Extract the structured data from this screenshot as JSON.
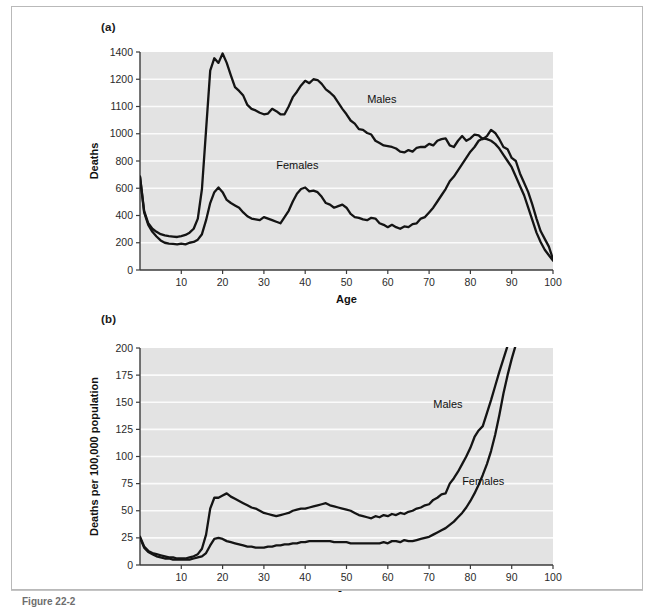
{
  "figure": {
    "panel_a_tag": "(a)",
    "panel_b_tag": "(b)",
    "caption": "Figure 22-2"
  },
  "chart_data": [
    {
      "id": "panel-a",
      "type": "line",
      "title": "(a)",
      "xlabel": "Age",
      "ylabel": "Deaths",
      "xlim": [
        0,
        100
      ],
      "ylim": [
        0,
        1400
      ],
      "grid": true,
      "legend_position": "inline-annotation",
      "xticks": [
        10,
        20,
        30,
        40,
        50,
        60,
        70,
        80,
        90,
        100
      ],
      "xtick_labels": [
        "10",
        "20",
        "30",
        "40",
        "50",
        "60",
        "70",
        "80",
        "90",
        "100"
      ],
      "yticks": [
        0,
        200,
        400,
        600,
        800,
        1000,
        1100,
        1200,
        1400
      ],
      "ytick_labels": [
        "0",
        "200",
        "400",
        "600",
        "800",
        "1000",
        "1100",
        "1200",
        "1400"
      ],
      "series": [
        {
          "name": "Males",
          "label_x": 55,
          "label_y": 1075,
          "x": [
            0,
            1,
            2,
            3,
            4,
            5,
            6,
            7,
            8,
            9,
            10,
            11,
            12,
            13,
            14,
            15,
            16,
            17,
            18,
            19,
            20,
            21,
            22,
            23,
            24,
            25,
            26,
            27,
            28,
            29,
            30,
            31,
            32,
            33,
            34,
            35,
            36,
            37,
            38,
            39,
            40,
            41,
            42,
            43,
            44,
            45,
            46,
            47,
            48,
            49,
            50,
            51,
            52,
            53,
            54,
            55,
            56,
            57,
            58,
            59,
            60,
            61,
            62,
            63,
            64,
            65,
            66,
            67,
            68,
            69,
            70,
            71,
            72,
            73,
            74,
            75,
            76,
            77,
            78,
            79,
            80,
            81,
            82,
            83,
            84,
            85,
            86,
            87,
            88,
            89,
            90,
            91,
            92,
            93,
            94,
            95,
            96,
            97,
            98,
            99,
            100
          ],
          "y": [
            600,
            380,
            300,
            265,
            245,
            230,
            222,
            218,
            215,
            212,
            218,
            225,
            240,
            265,
            330,
            520,
            900,
            1280,
            1360,
            1330,
            1390,
            1330,
            1250,
            1175,
            1150,
            1120,
            1060,
            1035,
            1025,
            1010,
            1000,
            1005,
            1035,
            1020,
            1000,
            1000,
            1050,
            1110,
            1145,
            1185,
            1215,
            1200,
            1225,
            1220,
            1195,
            1160,
            1140,
            1115,
            1075,
            1035,
            1000,
            960,
            940,
            905,
            900,
            880,
            870,
            830,
            815,
            800,
            795,
            790,
            780,
            760,
            755,
            770,
            760,
            785,
            790,
            790,
            810,
            800,
            830,
            840,
            845,
            800,
            790,
            830,
            860,
            830,
            845,
            870,
            865,
            840,
            860,
            900,
            880,
            840,
            790,
            775,
            720,
            700,
            620,
            560,
            500,
            420,
            330,
            250,
            200,
            150,
            70
          ]
        },
        {
          "name": "Females",
          "label_x": 33,
          "label_y": 650,
          "x": [
            0,
            1,
            2,
            3,
            4,
            5,
            6,
            7,
            8,
            9,
            10,
            11,
            12,
            13,
            14,
            15,
            16,
            17,
            18,
            19,
            20,
            21,
            22,
            23,
            24,
            25,
            26,
            27,
            28,
            29,
            30,
            31,
            32,
            33,
            34,
            35,
            36,
            37,
            38,
            39,
            40,
            41,
            42,
            43,
            44,
            45,
            46,
            47,
            48,
            49,
            50,
            51,
            52,
            53,
            54,
            55,
            56,
            57,
            58,
            59,
            60,
            61,
            62,
            63,
            64,
            65,
            66,
            67,
            68,
            69,
            70,
            71,
            72,
            73,
            74,
            75,
            76,
            77,
            78,
            79,
            80,
            81,
            82,
            83,
            84,
            85,
            86,
            87,
            88,
            89,
            90,
            91,
            92,
            93,
            94,
            95,
            96,
            97,
            98,
            99,
            100
          ],
          "y": [
            600,
            370,
            290,
            245,
            215,
            190,
            175,
            170,
            168,
            165,
            170,
            165,
            175,
            180,
            195,
            230,
            320,
            430,
            500,
            530,
            500,
            450,
            430,
            415,
            400,
            370,
            345,
            330,
            325,
            320,
            340,
            330,
            320,
            310,
            300,
            340,
            380,
            440,
            490,
            520,
            530,
            505,
            510,
            500,
            470,
            430,
            420,
            400,
            410,
            420,
            400,
            360,
            340,
            335,
            325,
            320,
            335,
            330,
            300,
            290,
            275,
            290,
            275,
            265,
            280,
            275,
            295,
            300,
            330,
            340,
            370,
            400,
            440,
            480,
            520,
            570,
            600,
            640,
            680,
            720,
            760,
            790,
            830,
            845,
            840,
            830,
            810,
            780,
            740,
            700,
            660,
            600,
            540,
            480,
            400,
            320,
            240,
            180,
            130,
            95,
            60
          ]
        }
      ]
    },
    {
      "id": "panel-b",
      "type": "line",
      "title": "(b)",
      "xlabel": "Age",
      "ylabel": "Deaths per 100,000 population",
      "xlim": [
        0,
        100
      ],
      "ylim": [
        0,
        200
      ],
      "grid": true,
      "legend_position": "inline-annotation",
      "xticks": [
        10,
        20,
        30,
        40,
        50,
        60,
        70,
        80,
        90,
        100
      ],
      "xtick_labels": [
        "10",
        "20",
        "30",
        "40",
        "50",
        "60",
        "70",
        "80",
        "90",
        "100"
      ],
      "yticks": [
        0,
        25,
        50,
        75,
        100,
        125,
        150,
        175,
        200
      ],
      "ytick_labels": [
        "0",
        "25",
        "50",
        "75",
        "100",
        "125",
        "150",
        "175",
        "200"
      ],
      "series": [
        {
          "name": "Males",
          "label_x": 71,
          "label_y": 145,
          "x": [
            0,
            1,
            2,
            3,
            4,
            5,
            6,
            7,
            8,
            9,
            10,
            11,
            12,
            13,
            14,
            15,
            16,
            17,
            18,
            19,
            20,
            21,
            22,
            23,
            24,
            25,
            26,
            27,
            28,
            29,
            30,
            31,
            32,
            33,
            34,
            35,
            36,
            37,
            38,
            39,
            40,
            41,
            42,
            43,
            44,
            45,
            46,
            47,
            48,
            49,
            50,
            51,
            52,
            53,
            54,
            55,
            56,
            57,
            58,
            59,
            60,
            61,
            62,
            63,
            64,
            65,
            66,
            67,
            68,
            69,
            70,
            71,
            72,
            73,
            74,
            75,
            76,
            77,
            78,
            79,
            80,
            81,
            82,
            83,
            84,
            85,
            86,
            87,
            88,
            89
          ],
          "y": [
            26,
            17,
            13,
            11,
            10,
            9,
            8,
            7,
            7,
            6,
            6,
            6,
            7,
            8,
            10,
            15,
            28,
            52,
            62,
            62,
            64,
            66,
            63,
            61,
            59,
            57,
            55,
            53,
            52,
            50,
            48,
            47,
            46,
            45,
            46,
            47,
            48,
            50,
            51,
            52,
            52,
            53,
            54,
            55,
            56,
            57,
            55,
            54,
            53,
            52,
            51,
            50,
            48,
            46,
            45,
            44,
            43,
            45,
            44,
            46,
            45,
            47,
            46,
            48,
            47,
            49,
            50,
            52,
            53,
            55,
            56,
            60,
            62,
            65,
            66,
            75,
            80,
            86,
            93,
            100,
            108,
            118,
            124,
            128,
            140,
            152,
            165,
            178,
            190,
            202
          ]
        },
        {
          "name": "Females",
          "label_x": 78,
          "label_y": 74,
          "x": [
            0,
            1,
            2,
            3,
            4,
            5,
            6,
            7,
            8,
            9,
            10,
            11,
            12,
            13,
            14,
            15,
            16,
            17,
            18,
            19,
            20,
            21,
            22,
            23,
            24,
            25,
            26,
            27,
            28,
            29,
            30,
            31,
            32,
            33,
            34,
            35,
            36,
            37,
            38,
            39,
            40,
            41,
            42,
            43,
            44,
            45,
            46,
            47,
            48,
            49,
            50,
            51,
            52,
            53,
            54,
            55,
            56,
            57,
            58,
            59,
            60,
            61,
            62,
            63,
            64,
            65,
            66,
            67,
            68,
            69,
            70,
            71,
            72,
            73,
            74,
            75,
            76,
            77,
            78,
            79,
            80,
            81,
            82,
            83,
            84,
            85,
            86,
            87,
            88,
            89,
            90,
            91
          ],
          "y": [
            25,
            16,
            12,
            10,
            8,
            7,
            6,
            6,
            5,
            5,
            5,
            5,
            5,
            6,
            7,
            8,
            11,
            18,
            24,
            25,
            24,
            22,
            21,
            20,
            19,
            18,
            17,
            17,
            16,
            16,
            16,
            17,
            17,
            18,
            18,
            19,
            19,
            20,
            20,
            21,
            21,
            22,
            22,
            22,
            22,
            22,
            22,
            21,
            21,
            21,
            21,
            20,
            20,
            20,
            20,
            20,
            20,
            20,
            20,
            21,
            20,
            22,
            22,
            21,
            23,
            22,
            22,
            23,
            24,
            25,
            26,
            28,
            30,
            32,
            34,
            37,
            40,
            44,
            48,
            53,
            59,
            66,
            74,
            83,
            93,
            105,
            120,
            138,
            158,
            175,
            190,
            203
          ]
        }
      ]
    }
  ]
}
